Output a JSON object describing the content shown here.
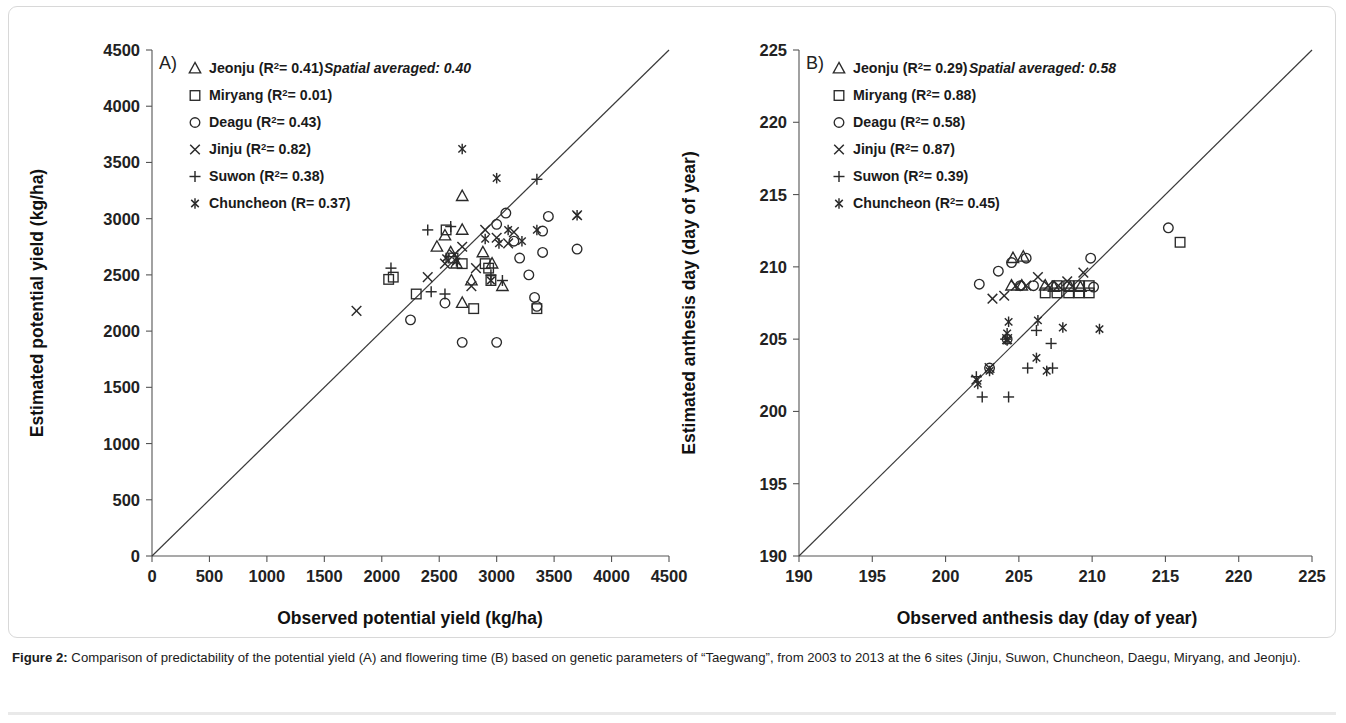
{
  "figure": {
    "caption_label": "Figure 2:",
    "caption_text": " Comparison of predictability of the potential yield (A) and flowering time (B) based on genetic parameters of “Taegwang”, from 2003 to 2013 at the 6 sites (Jinju, Suwon, Chuncheon, Daegu, Miryang, and Jeonju)."
  },
  "chart_data": [
    {
      "type": "scatter",
      "panel": "A",
      "panel_letter": "A)",
      "title": "",
      "xlabel": "Observed potential yield (kg/ha)",
      "ylabel": "Estimated potential yield (kg/ha)",
      "xlim": [
        0,
        4500
      ],
      "ylim": [
        0,
        4500
      ],
      "xticks": [
        0,
        500,
        1000,
        1500,
        2000,
        2500,
        3000,
        3500,
        4000,
        4500
      ],
      "yticks": [
        0,
        500,
        1000,
        1500,
        2000,
        2500,
        3000,
        3500,
        4000,
        4500
      ],
      "grid": false,
      "identity_line": true,
      "annotation": "Spatial averaged: 0.40",
      "legend_position": "top-left",
      "series": [
        {
          "name": "Jeonju",
          "marker": "triangle",
          "r2_label": "Jeonju (R²= 0.41)",
          "r2": 0.41,
          "points": [
            [
              2700,
              3200
            ],
            [
              2550,
              2850
            ],
            [
              2700,
              2900
            ],
            [
              2480,
              2750
            ],
            [
              2650,
              2600
            ],
            [
              2780,
              2450
            ],
            [
              2700,
              2250
            ],
            [
              3050,
              2400
            ],
            [
              2880,
              2700
            ],
            [
              2600,
              2700
            ],
            [
              2960,
              2600
            ]
          ]
        },
        {
          "name": "Miryang",
          "marker": "square",
          "r2_label": "Miryang (R²= 0.01)",
          "r2": 0.01,
          "points": [
            [
              2100,
              2480
            ],
            [
              2060,
              2460
            ],
            [
              2560,
              2900
            ],
            [
              2300,
              2330
            ],
            [
              2700,
              2600
            ],
            [
              2900,
              2600
            ],
            [
              2950,
              2450
            ],
            [
              2800,
              2200
            ],
            [
              2930,
              2560
            ],
            [
              2620,
              2650
            ],
            [
              3350,
              2200
            ]
          ]
        },
        {
          "name": "Deagu",
          "marker": "circle",
          "r2_label": "Deagu (R²= 0.43)",
          "r2": 0.43,
          "points": [
            [
              2250,
              2100
            ],
            [
              2550,
              2250
            ],
            [
              2700,
              1900
            ],
            [
              3000,
              1900
            ],
            [
              3080,
              3050
            ],
            [
              3000,
              2950
            ],
            [
              3150,
              2800
            ],
            [
              3200,
              2650
            ],
            [
              3280,
              2500
            ],
            [
              3330,
              2300
            ],
            [
              3350,
              2220
            ],
            [
              3400,
              2890
            ],
            [
              3450,
              3020
            ],
            [
              3700,
              2730
            ],
            [
              3400,
              2700
            ]
          ]
        },
        {
          "name": "Jinju",
          "marker": "x",
          "r2_label": "Jinju (R²= 0.82)",
          "r2": 0.82,
          "points": [
            [
              1780,
              2180
            ],
            [
              2400,
              2480
            ],
            [
              2550,
              2600
            ],
            [
              2630,
              2680
            ],
            [
              2700,
              2750
            ],
            [
              2900,
              2900
            ],
            [
              3000,
              2830
            ],
            [
              3100,
              2780
            ],
            [
              2820,
              2560
            ],
            [
              2780,
              2400
            ],
            [
              3700,
              3030
            ],
            [
              3150,
              2880
            ]
          ]
        },
        {
          "name": "Suwon",
          "marker": "plus",
          "r2_label": "Suwon (R²= 0.38)",
          "r2": 0.38,
          "points": [
            [
              2080,
              2560
            ],
            [
              2400,
              2900
            ],
            [
              2600,
              2930
            ],
            [
              2550,
              2330
            ],
            [
              3350,
              3350
            ],
            [
              3050,
              2450
            ],
            [
              2950,
              2500
            ],
            [
              2430,
              2350
            ]
          ]
        },
        {
          "name": "Chuncheon",
          "marker": "asterisk",
          "r2_label": "Chuncheon (R= 0.37)",
          "r2": 0.37,
          "points": [
            [
              2700,
              3620
            ],
            [
              3000,
              3360
            ],
            [
              2560,
              2650
            ],
            [
              2650,
              2620
            ],
            [
              2900,
              2820
            ],
            [
              3020,
              2780
            ],
            [
              3100,
              2900
            ],
            [
              3220,
              2800
            ],
            [
              3350,
              2900
            ],
            [
              3700,
              3030
            ],
            [
              2950,
              2450
            ]
          ]
        }
      ]
    },
    {
      "type": "scatter",
      "panel": "B",
      "panel_letter": "B)",
      "title": "",
      "xlabel": "Observed anthesis day (day of year)",
      "ylabel": "Estimated anthesis day (day of year)",
      "xlim": [
        190,
        225
      ],
      "ylim": [
        190,
        225
      ],
      "xticks": [
        190,
        195,
        200,
        205,
        210,
        215,
        220,
        225
      ],
      "yticks": [
        190,
        195,
        200,
        205,
        210,
        215,
        220,
        225
      ],
      "grid": false,
      "identity_line": true,
      "annotation": "Spatial averaged: 0.58",
      "legend_position": "top-left",
      "series": [
        {
          "name": "Jeonju",
          "marker": "triangle",
          "r2_label": "Jeonju (R²= 0.29)",
          "r2": 0.29,
          "points": [
            [
              204.6,
              210.6
            ],
            [
              205.3,
              210.7
            ],
            [
              204.5,
              208.7
            ],
            [
              205.2,
              208.7
            ],
            [
              206.8,
              208.7
            ],
            [
              207.4,
              208.6
            ],
            [
              208.5,
              208.6
            ],
            [
              209.2,
              208.6
            ]
          ]
        },
        {
          "name": "Miryang",
          "marker": "square",
          "r2_label": "Miryang (R²= 0.88)",
          "r2": 0.88,
          "points": [
            [
              206.8,
              208.2
            ],
            [
              207.6,
              208.2
            ],
            [
              208.4,
              208.2
            ],
            [
              209.1,
              208.2
            ],
            [
              209.8,
              208.2
            ],
            [
              207.6,
              208.7
            ],
            [
              208.4,
              208.7
            ],
            [
              209.1,
              208.7
            ],
            [
              209.8,
              208.7
            ],
            [
              216.0,
              211.7
            ]
          ]
        },
        {
          "name": "Deagu",
          "marker": "circle",
          "r2_label": "Deagu (R²= 0.58)",
          "r2": 0.58,
          "points": [
            [
              202.3,
              208.8
            ],
            [
              203.6,
              209.7
            ],
            [
              204.5,
              210.3
            ],
            [
              205.5,
              210.6
            ],
            [
              205.1,
              208.7
            ],
            [
              206.0,
              208.7
            ],
            [
              209.9,
              210.6
            ],
            [
              210.1,
              208.6
            ],
            [
              215.2,
              212.7
            ],
            [
              204.2,
              205.0
            ],
            [
              203.0,
              203.0
            ]
          ]
        },
        {
          "name": "Jinju",
          "marker": "x",
          "r2_label": "Jinju (R²= 0.87)",
          "r2": 0.87,
          "points": [
            [
              203.2,
              207.8
            ],
            [
              204.0,
              208.0
            ],
            [
              204.8,
              208.7
            ],
            [
              205.5,
              208.7
            ],
            [
              206.3,
              209.3
            ],
            [
              207.0,
              208.7
            ],
            [
              207.7,
              208.7
            ],
            [
              208.3,
              209.0
            ],
            [
              209.4,
              209.6
            ],
            [
              204.2,
              205.0
            ],
            [
              203.0,
              203.0
            ],
            [
              202.1,
              202.2
            ]
          ]
        },
        {
          "name": "Suwon",
          "marker": "plus",
          "r2_label": "Suwon (R²= 0.39)",
          "r2": 0.39,
          "points": [
            [
              202.1,
              202.4
            ],
            [
              202.5,
              201.0
            ],
            [
              204.3,
              201.0
            ],
            [
              205.6,
              203.0
            ],
            [
              207.3,
              203.0
            ],
            [
              207.2,
              204.7
            ],
            [
              206.2,
              205.6
            ],
            [
              204.1,
              205.0
            ]
          ]
        },
        {
          "name": "Chuncheon",
          "marker": "asterisk",
          "r2_label": "Chuncheon (R²= 0.45)",
          "r2": 0.45,
          "points": [
            [
              202.2,
              201.9
            ],
            [
              203.0,
              202.8
            ],
            [
              204.2,
              204.9
            ],
            [
              204.3,
              206.2
            ],
            [
              206.3,
              206.3
            ],
            [
              206.2,
              203.7
            ],
            [
              206.9,
              202.8
            ],
            [
              208.0,
              205.8
            ],
            [
              210.5,
              205.7
            ],
            [
              204.2,
              205.4
            ]
          ]
        }
      ]
    }
  ]
}
